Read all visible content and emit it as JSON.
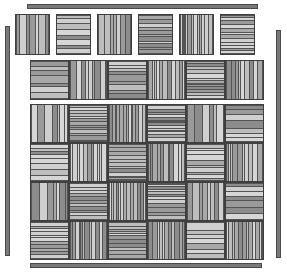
{
  "figure": {
    "background_color": "#ffffff",
    "width": 287,
    "height": 272
  },
  "palette": {
    "stripe_light": "#d6d6d6",
    "stripe_mid": "#a8a8a8",
    "stripe_dark": "#8c8c8c",
    "stripe_line": "#545454",
    "tile_border": "#3f3f3f",
    "rule_fill": "#7a7a7a",
    "rule_border": "#4a4a4a"
  },
  "rules": [
    {
      "name": "top-rule",
      "orientation": "horizontal",
      "x": 27,
      "y": 4,
      "length": 231
    },
    {
      "name": "bottom-rule",
      "orientation": "horizontal",
      "x": 30,
      "y": 263,
      "length": 232
    },
    {
      "name": "left-rule",
      "orientation": "vertical",
      "x": 5,
      "y": 26,
      "length": 230
    },
    {
      "name": "right-rule",
      "orientation": "vertical",
      "x": 276,
      "y": 30,
      "length": 228
    }
  ],
  "groups": [
    {
      "name": "top-tile-strip",
      "x": 15,
      "y": 14,
      "cols": 6,
      "rows": 1,
      "tile_w": 35,
      "tile_h": 41,
      "gap_x": 6,
      "gap_y": 0,
      "start_orientation": "vertical",
      "alternate": "row-major",
      "seed": 11
    },
    {
      "name": "middle-tile-band",
      "x": 30,
      "y": 60,
      "cols": 6,
      "rows": 1,
      "tile_w": 39,
      "tile_h": 40,
      "gap_x": 0,
      "gap_y": 0,
      "start_orientation": "horizontal",
      "alternate": "row-major",
      "seed": 29
    },
    {
      "name": "main-weave-grid",
      "x": 30,
      "y": 104,
      "cols": 6,
      "rows": 4,
      "tile_w": 39,
      "tile_h": 39,
      "gap_x": 0,
      "gap_y": 0,
      "start_orientation": "vertical",
      "alternate": "checkerboard",
      "seed": 47
    }
  ],
  "stripe_model": {
    "description": "Each tile is filled with parallel bands of varying width and gray value, separated by thin dark lines.",
    "min_bands": 7,
    "max_bands": 14,
    "band_values": [
      "#d6d6d6",
      "#cfcfcf",
      "#bdbdbd",
      "#a8a8a8",
      "#9a9a9a",
      "#8c8c8c"
    ],
    "line_color": "#545454",
    "line_width_px": 1
  }
}
